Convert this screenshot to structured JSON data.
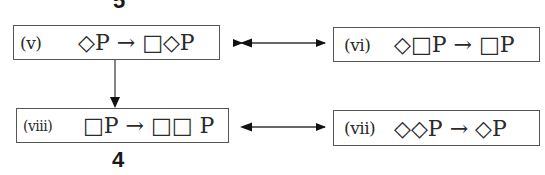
{
  "diagram": {
    "numbers": {
      "top": "5",
      "bottom": "4"
    },
    "nodes": [
      {
        "id": "v",
        "label": "(v)",
        "formula": "◇P → □◇P"
      },
      {
        "id": "vi",
        "label": "(vi)",
        "formula": "◇□P → □P"
      },
      {
        "id": "viii",
        "label": "(viii)",
        "formula": "□P → □□ P"
      },
      {
        "id": "vii",
        "label": "(vii)",
        "formula": "◇◇P → ◇P"
      }
    ],
    "edges": [
      {
        "from": "v",
        "to": "vi",
        "type": "bidirectional"
      },
      {
        "from": "v",
        "to": "viii",
        "type": "directed"
      },
      {
        "from": "viii",
        "to": "vii",
        "type": "bidirectional"
      }
    ]
  }
}
